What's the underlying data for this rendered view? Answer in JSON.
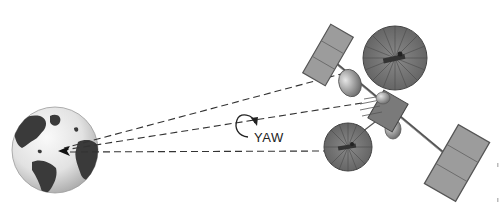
{
  "diagram": {
    "labels": {
      "yaw": "YAW"
    },
    "colors": {
      "background": "#ffffff",
      "globe_ocean": "#e4e4e4",
      "globe_land": "#3a3a3a",
      "dashed_line": "#333333",
      "panel_fill": "#9a9a9a",
      "panel_frame": "#555555",
      "dish_fill": "#6f6f6f",
      "dish_rib": "#4a4a4a",
      "body_fill": "#7a7a7a"
    },
    "elements": [
      {
        "name": "earth-globe",
        "center": [
          55,
          150
        ],
        "radius": 43
      },
      {
        "name": "signal-beam-upper",
        "from": [
          345,
          73
        ],
        "to": [
          60,
          150
        ]
      },
      {
        "name": "signal-beam-middle",
        "from": [
          360,
          105
        ],
        "to": [
          60,
          150
        ]
      },
      {
        "name": "signal-beam-lower",
        "from": [
          330,
          150
        ],
        "to": [
          60,
          150
        ]
      },
      {
        "name": "yaw-rotation-arrow",
        "center": [
          246,
          127
        ]
      },
      {
        "name": "solar-panel-upper-left",
        "center": [
          328,
          55
        ]
      },
      {
        "name": "dish-antenna-upper",
        "center": [
          395,
          57
        ],
        "radius": 32
      },
      {
        "name": "satellite-body",
        "center": [
          388,
          113
        ]
      },
      {
        "name": "dish-antenna-lower",
        "center": [
          348,
          147
        ],
        "radius": 24
      },
      {
        "name": "solar-panel-lower-right",
        "center": [
          455,
          163
        ]
      }
    ]
  }
}
